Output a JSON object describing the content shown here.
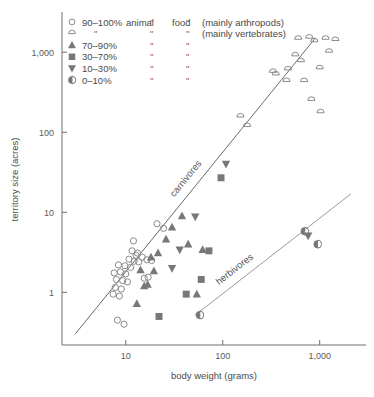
{
  "chart_data": {
    "type": "scatter",
    "title": "",
    "xlabel": "body weight (grams)",
    "ylabel": "territory size (acres)",
    "xscale": "log",
    "yscale": "log",
    "xlim": [
      2.2,
      3000
    ],
    "ylim": [
      0.22,
      3000
    ],
    "xticks": [
      {
        "value": 10,
        "label": "10"
      },
      {
        "value": 100,
        "label": "100"
      },
      {
        "value": 1000,
        "label": "1,000"
      }
    ],
    "yticks": [
      {
        "value": 1,
        "label": "1"
      },
      {
        "value": 10,
        "label": "10"
      },
      {
        "value": 100,
        "label": "100"
      },
      {
        "value": 1000,
        "label": "1,000"
      }
    ],
    "grid": false,
    "legend_position": "top-left",
    "legend": {
      "header_col1": "animal",
      "header_col2": "food",
      "note_arthropods": "(mainly arthropods)",
      "note_vertebrates": "(mainly vertebrates)",
      "ditto": "\"",
      "entries": [
        {
          "label": "90–100%",
          "marker": "open-circle"
        },
        {
          "label": "",
          "marker": "semicircle"
        },
        {
          "label": "70–90%",
          "marker": "triangle-up"
        },
        {
          "label": "30–70%",
          "marker": "square"
        },
        {
          "label": "10–30%",
          "marker": "triangle-down"
        },
        {
          "label": "0–10%",
          "marker": "half-filled-circle"
        }
      ]
    },
    "trend_lines": [
      {
        "name": "carnivores",
        "label": "carnivores",
        "x1": 3.0,
        "y1": 0.3,
        "x2": 900.0,
        "y2": 1500.0
      },
      {
        "name": "herbivores",
        "label": "herbivores",
        "x1": 52.0,
        "y1": 0.52,
        "x2": 2100.0,
        "y2": 17.0
      }
    ],
    "series": [
      {
        "name": "90–100% animal food (mainly arthropods)",
        "marker": "open-circle",
        "points": [
          [
            8.2,
            0.45
          ],
          [
            9.6,
            0.4
          ],
          [
            7.4,
            0.95
          ],
          [
            8.6,
            0.9
          ],
          [
            7.8,
            1.15
          ],
          [
            9.0,
            1.1
          ],
          [
            8.0,
            1.45
          ],
          [
            9.3,
            1.4
          ],
          [
            10.4,
            1.35
          ],
          [
            7.6,
            1.75
          ],
          [
            8.8,
            1.8
          ],
          [
            10.0,
            1.7
          ],
          [
            8.4,
            2.2
          ],
          [
            9.8,
            2.15
          ],
          [
            11.2,
            2.05
          ],
          [
            10.8,
            2.6
          ],
          [
            12.2,
            2.45
          ],
          [
            13.6,
            2.4
          ],
          [
            12.8,
            2.9
          ],
          [
            14.8,
            2.75
          ],
          [
            11.6,
            3.3
          ],
          [
            13.2,
            3.1
          ],
          [
            12.0,
            4.4
          ],
          [
            16.5,
            2.55
          ],
          [
            18.5,
            2.5
          ],
          [
            21.0,
            7.2
          ],
          [
            24.5,
            6.3
          ],
          [
            15.5,
            1.5
          ],
          [
            17.0,
            1.55
          ]
        ]
      },
      {
        "name": "90–100% animal food (mainly vertebrates)",
        "marker": "semicircle",
        "points": [
          [
            152,
            155
          ],
          [
            178,
            118
          ],
          [
            330,
            560
          ],
          [
            352,
            520
          ],
          [
            470,
            600
          ],
          [
            455,
            430
          ],
          [
            560,
            900
          ],
          [
            600,
            1450
          ],
          [
            640,
            760
          ],
          [
            690,
            430
          ],
          [
            780,
            1500
          ],
          [
            880,
            1350
          ],
          [
            1000,
            620
          ],
          [
            1150,
            1450
          ],
          [
            1250,
            1000
          ],
          [
            1450,
            1400
          ],
          [
            820,
            250
          ],
          [
            1020,
            175
          ]
        ]
      },
      {
        "name": "70–90% animal food",
        "marker": "triangle-up",
        "points": [
          [
            15.5,
            1.2
          ],
          [
            16.8,
            1.25
          ],
          [
            14.2,
            1.9
          ],
          [
            19.5,
            1.85
          ],
          [
            18.2,
            2.75
          ],
          [
            21.5,
            3.1
          ],
          [
            26.0,
            4.6
          ],
          [
            30.0,
            6.5
          ],
          [
            38.0,
            9.0
          ],
          [
            44.0,
            4.0
          ],
          [
            62.0,
            3.4
          ],
          [
            54.0,
            0.95
          ],
          [
            13.0,
            0.72
          ]
        ]
      },
      {
        "name": "30–70% animal food",
        "marker": "square",
        "points": [
          [
            22.0,
            0.5
          ],
          [
            42.0,
            0.95
          ],
          [
            60.0,
            1.45
          ],
          [
            72.0,
            3.3
          ],
          [
            96.0,
            27.0
          ]
        ]
      },
      {
        "name": "10–30% animal food",
        "marker": "triangle-down",
        "points": [
          [
            30.0,
            2.0
          ],
          [
            36.0,
            3.4
          ],
          [
            52.0,
            8.8
          ],
          [
            108.0,
            40.0
          ],
          [
            760,
            5.1
          ]
        ]
      },
      {
        "name": "0–10% animal food",
        "marker": "half-filled-circle",
        "points": [
          [
            58.0,
            0.52
          ],
          [
            700,
            5.8
          ],
          [
            950,
            4.0
          ]
        ]
      }
    ]
  }
}
